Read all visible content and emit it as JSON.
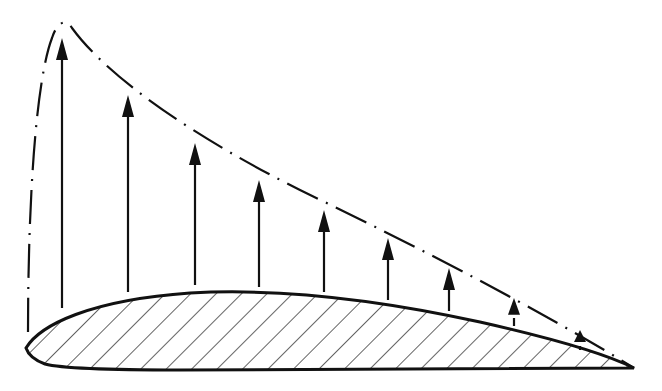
{
  "diagram": {
    "colors": {
      "ink": "#111111",
      "background": "#ffffff"
    },
    "airfoil": {
      "leading_edge": [
        26,
        348
      ],
      "trailing_edge": [
        634,
        368
      ],
      "upper_peak_y": 292,
      "lower_y": 370,
      "fill": "hatched-diagonal"
    },
    "envelope": {
      "style": "dash-dot",
      "peak": [
        62,
        22
      ],
      "start": [
        28,
        330
      ],
      "end": [
        634,
        368
      ]
    },
    "arrows": [
      {
        "x": 62,
        "base_y": 308,
        "tip_y": 38
      },
      {
        "x": 128,
        "base_y": 292,
        "tip_y": 95
      },
      {
        "x": 195,
        "base_y": 285,
        "tip_y": 143
      },
      {
        "x": 259,
        "base_y": 287,
        "tip_y": 180
      },
      {
        "x": 324,
        "base_y": 292,
        "tip_y": 210
      },
      {
        "x": 388,
        "base_y": 300,
        "tip_y": 238
      },
      {
        "x": 449,
        "base_y": 311,
        "tip_y": 268
      },
      {
        "x": 514,
        "base_y": 326,
        "tip_y": 298
      },
      {
        "x": 580,
        "base_y": 346,
        "tip_y": 330
      }
    ]
  }
}
